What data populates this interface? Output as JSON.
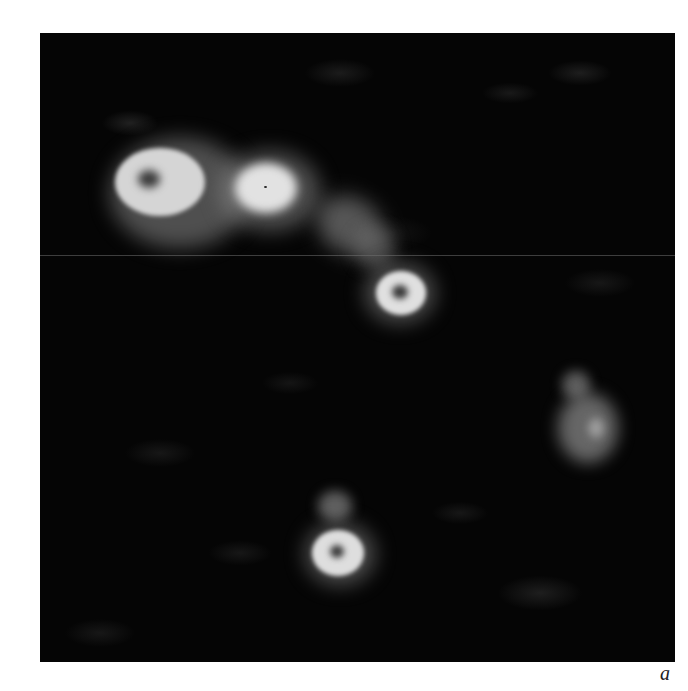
{
  "figure": {
    "panel_label": "a",
    "colors": {
      "background": "#ffffff",
      "image_background": "#050505",
      "structure": "#d8d8d8"
    },
    "structures": [
      {
        "name": "ring-large-top-left",
        "type": "ring",
        "cx": 110,
        "cy": 147
      },
      {
        "name": "blob-top-center",
        "type": "disk",
        "cx": 226,
        "cy": 155
      },
      {
        "name": "diffuse-chain",
        "type": "diffuse",
        "cx": 310,
        "cy": 205
      },
      {
        "name": "ring-center",
        "type": "ring",
        "cx": 360,
        "cy": 259
      },
      {
        "name": "diffuse-right",
        "type": "diffuse",
        "cx": 548,
        "cy": 395
      },
      {
        "name": "ring-bottom",
        "type": "ring",
        "cx": 298,
        "cy": 520
      }
    ]
  }
}
